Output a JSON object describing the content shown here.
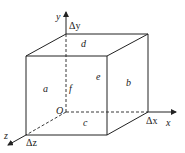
{
  "diagram": {
    "title": "",
    "axes": {
      "x": "x",
      "y": "y",
      "z": "z",
      "origin": "O"
    },
    "increments": {
      "dx": "Δx",
      "dy": "Δy",
      "dz": "Δz"
    },
    "faces": {
      "a": "a",
      "b": "b",
      "c": "c",
      "d": "d",
      "e": "e",
      "f": "f"
    },
    "colors": {
      "line": "#222222",
      "background": "#ffffff"
    }
  }
}
